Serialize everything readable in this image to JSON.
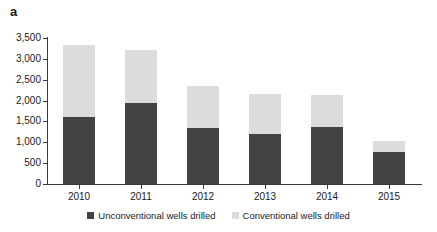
{
  "panel": {
    "label": "a"
  },
  "chart_data": {
    "type": "bar",
    "subtype": "stacked-bar",
    "title": "",
    "xlabel": "",
    "ylabel": "",
    "categories": [
      "2010",
      "2011",
      "2012",
      "2013",
      "2014",
      "2015"
    ],
    "series": [
      {
        "name": "Unconventional wells drilled",
        "color": "#434343",
        "values": [
          1600,
          1950,
          1340,
          1200,
          1360,
          770
        ]
      },
      {
        "name": "Conventional wells drilled",
        "color": "#dcdcdc",
        "values": [
          1730,
          1270,
          1010,
          960,
          780,
          270
        ]
      }
    ],
    "totals": [
      3330,
      3220,
      2350,
      2160,
      2140,
      1040
    ],
    "ylim": [
      0,
      3500
    ],
    "y_ticks": [
      0,
      500,
      1000,
      1500,
      2000,
      2500,
      3000,
      3500
    ],
    "y_tick_labels": [
      "0",
      "500",
      "1,000",
      "1,500",
      "2,000",
      "2,500",
      "3,000",
      "3,500"
    ],
    "grid": false,
    "legend_position": "bottom"
  },
  "legend": {
    "items": [
      {
        "label": "Unconventional wells drilled",
        "color": "#434343"
      },
      {
        "label": "Conventional wells drilled",
        "color": "#dcdcdc"
      }
    ]
  },
  "colors": {
    "unconventional": "#434343",
    "conventional": "#dcdcdc",
    "axis": "#3a3a3a",
    "text": "#1a1a1a",
    "background": "#ffffff"
  }
}
